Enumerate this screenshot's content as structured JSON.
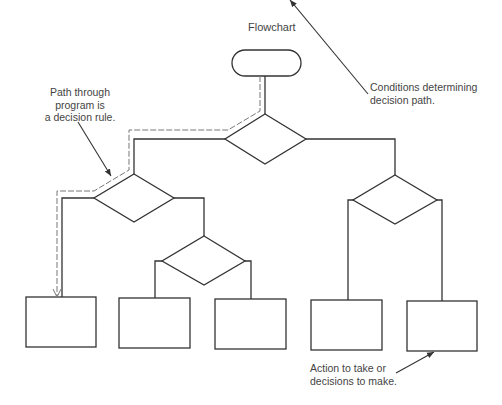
{
  "title": "Flowchart",
  "annotations": {
    "path_rule": [
      "Path through",
      "program is",
      "a decision rule."
    ],
    "conditions": [
      "Conditions determining",
      "decision path."
    ],
    "actions": [
      "Action to take or",
      "decisions to make."
    ]
  },
  "nodes": {
    "start": {
      "type": "terminator"
    },
    "decisions": [
      "decision-1",
      "decision-2",
      "decision-3",
      "decision-4"
    ],
    "actions": [
      "action-1",
      "action-2",
      "action-3",
      "action-4",
      "action-5"
    ]
  },
  "colors": {
    "line": "#333333",
    "path": "#777777",
    "text": "#444444"
  }
}
